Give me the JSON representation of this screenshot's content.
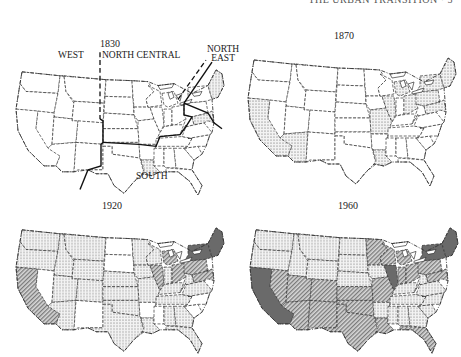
{
  "header": {
    "running_head": "THE URBAN TRANSITION  ·  5"
  },
  "legend_fills": {
    "none": "#ffffff",
    "dotted": "url(#dots)",
    "hatched": "url(#hatch)",
    "solid": "#6a6a6a"
  },
  "maps": [
    {
      "year": "1830",
      "region_labels": {
        "west": "WEST",
        "north_central": "NORTH CENTRAL",
        "north_east_1": "NORTH",
        "north_east_2": "EAST",
        "south": "SOUTH"
      },
      "fills": {
        "WA": "none",
        "OR": "none",
        "CA": "none",
        "ID": "none",
        "NV": "none",
        "MT": "none",
        "WY": "none",
        "UT": "none",
        "AZ": "none",
        "CO": "none",
        "NM": "none",
        "ND": "none",
        "SD": "none",
        "NE": "none",
        "KS": "none",
        "OK": "none",
        "TX": "none",
        "MN": "none",
        "IA": "none",
        "MO": "none",
        "AR": "none",
        "LA": "dotted",
        "WI": "none",
        "IL": "none",
        "MI": "none",
        "IN": "none",
        "OH": "none",
        "KY": "none",
        "TN": "none",
        "MS": "none",
        "AL": "none",
        "GA": "none",
        "FL": "none",
        "SC": "none",
        "NC": "none",
        "VA": "none",
        "WV": "none",
        "PA": "none",
        "NY": "none",
        "NE_ST": "dotted",
        "MDDE": "dotted"
      }
    },
    {
      "year": "1870",
      "fills": {
        "WA": "none",
        "OR": "none",
        "CA": "dotted",
        "ID": "none",
        "NV": "none",
        "MT": "none",
        "WY": "none",
        "UT": "none",
        "AZ": "dotted",
        "CO": "none",
        "NM": "none",
        "ND": "none",
        "SD": "none",
        "NE": "none",
        "KS": "none",
        "OK": "none",
        "TX": "none",
        "MN": "none",
        "IA": "none",
        "MO": "dotted",
        "AR": "none",
        "LA": "dotted",
        "WI": "none",
        "IL": "dotted",
        "MI": "dotted",
        "IN": "none",
        "OH": "dotted",
        "KY": "none",
        "TN": "none",
        "MS": "none",
        "AL": "none",
        "GA": "none",
        "FL": "none",
        "SC": "none",
        "NC": "none",
        "VA": "none",
        "WV": "none",
        "PA": "dotted",
        "NY": "dotted",
        "NE_ST": "dotted",
        "MDDE": "dotted"
      }
    },
    {
      "year": "1920",
      "fills": {
        "WA": "dotted",
        "OR": "dotted",
        "CA": "hatched",
        "ID": "dotted",
        "NV": "none",
        "MT": "dotted",
        "WY": "dotted",
        "UT": "dotted",
        "AZ": "dotted",
        "CO": "dotted",
        "NM": "none",
        "ND": "none",
        "SD": "none",
        "NE": "dotted",
        "KS": "dotted",
        "OK": "dotted",
        "TX": "dotted",
        "MN": "dotted",
        "IA": "dotted",
        "MO": "dotted",
        "AR": "none",
        "LA": "dotted",
        "WI": "dotted",
        "IL": "hatched",
        "MI": "hatched",
        "IN": "dotted",
        "OH": "hatched",
        "KY": "dotted",
        "TN": "dotted",
        "MS": "none",
        "AL": "dotted",
        "GA": "dotted",
        "FL": "dotted",
        "SC": "none",
        "NC": "none",
        "VA": "dotted",
        "WV": "dotted",
        "PA": "hatched",
        "NY": "solid",
        "NE_ST": "solid",
        "MDDE": "hatched"
      }
    },
    {
      "year": "1960",
      "fills": {
        "WA": "dotted",
        "OR": "dotted",
        "CA": "solid",
        "ID": "dotted",
        "NV": "hatched",
        "MT": "dotted",
        "WY": "dotted",
        "UT": "hatched",
        "AZ": "hatched",
        "CO": "hatched",
        "NM": "hatched",
        "ND": "dotted",
        "SD": "dotted",
        "NE": "dotted",
        "KS": "hatched",
        "OK": "hatched",
        "TX": "hatched",
        "MN": "hatched",
        "IA": "dotted",
        "MO": "hatched",
        "AR": "dotted",
        "LA": "hatched",
        "WI": "hatched",
        "IL": "solid",
        "MI": "hatched",
        "IN": "hatched",
        "OH": "hatched",
        "KY": "dotted",
        "TN": "dotted",
        "MS": "dotted",
        "AL": "dotted",
        "GA": "dotted",
        "FL": "hatched",
        "SC": "dotted",
        "NC": "dotted",
        "VA": "dotted",
        "WV": "dotted",
        "PA": "hatched",
        "NY": "solid",
        "NE_ST": "solid",
        "MDDE": "hatched"
      }
    }
  ]
}
